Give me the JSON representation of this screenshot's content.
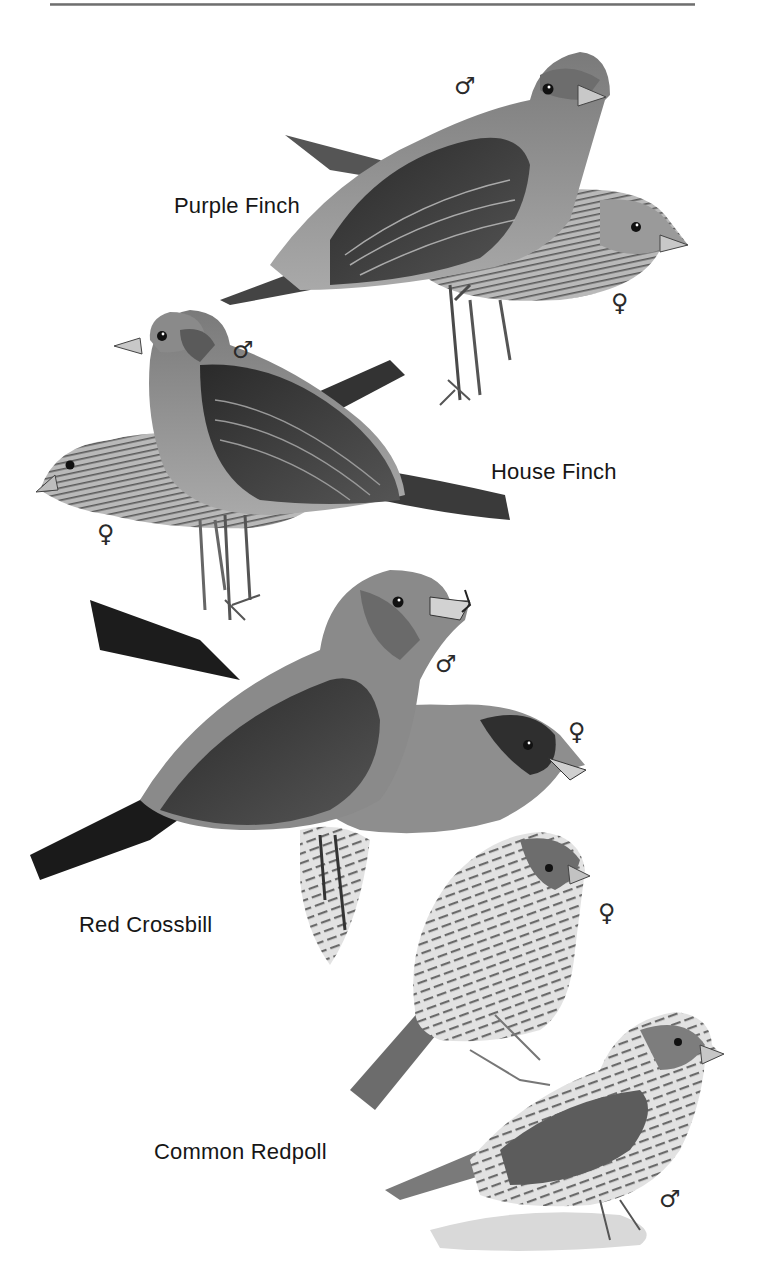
{
  "page": {
    "type": "field-guide-plate",
    "header_rule": true
  },
  "species": [
    {
      "name": "Purple Finch",
      "label_pos": {
        "x": 174,
        "y": 193
      },
      "figures": [
        {
          "sex": "male",
          "symbol": "♂",
          "symbol_pos": {
            "x": 454,
            "y": 74
          }
        },
        {
          "sex": "female",
          "symbol": "♀",
          "symbol_pos": {
            "x": 611,
            "y": 291
          }
        }
      ]
    },
    {
      "name": "House Finch",
      "label_pos": {
        "x": 491,
        "y": 459
      },
      "figures": [
        {
          "sex": "male",
          "symbol": "♂",
          "symbol_pos": {
            "x": 232,
            "y": 338
          }
        },
        {
          "sex": "female",
          "symbol": "♀",
          "symbol_pos": {
            "x": 97,
            "y": 522
          }
        }
      ]
    },
    {
      "name": "Red Crossbill",
      "label_pos": {
        "x": 79,
        "y": 912
      },
      "figures": [
        {
          "sex": "male",
          "symbol": "♂",
          "symbol_pos": {
            "x": 435,
            "y": 652
          }
        },
        {
          "sex": "female",
          "symbol": "♀",
          "symbol_pos": {
            "x": 568,
            "y": 720
          }
        }
      ]
    },
    {
      "name": "Common Redpoll",
      "label_pos": {
        "x": 154,
        "y": 1139
      },
      "figures": [
        {
          "sex": "female",
          "symbol": "♀",
          "symbol_pos": {
            "x": 598,
            "y": 901
          }
        },
        {
          "sex": "male",
          "symbol": "♂",
          "symbol_pos": {
            "x": 659,
            "y": 1187
          }
        }
      ]
    }
  ],
  "colors": {
    "background": "#ffffff",
    "ink": "#161616",
    "rule": "#7a7a7a"
  }
}
